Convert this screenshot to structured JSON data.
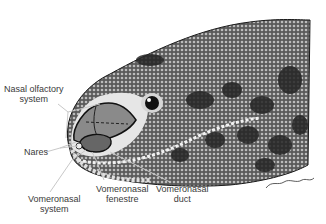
{
  "figure": {
    "signature": "Hornsby Rowe",
    "labels": [
      {
        "id": "nasal-olfactory",
        "lines": [
          "Nasal olfactory",
          "system"
        ]
      },
      {
        "id": "nares",
        "lines": [
          "Nares"
        ]
      },
      {
        "id": "vomeronasal-system",
        "lines": [
          "Vomeronasal",
          "system"
        ]
      },
      {
        "id": "vomeronasal-fenestre",
        "lines": [
          "Vomeronasal",
          "fenestre"
        ]
      },
      {
        "id": "vomeronasal-duct",
        "lines": [
          "Vomeronasal",
          "duct"
        ]
      }
    ],
    "colors": {
      "skin_dark": "#2a2a2a",
      "skin_mid": "#6b6b6b",
      "skin_light": "#bdbdbd",
      "snout_highlight": "#e6e6e6",
      "organ_fill": "#8a8a8a",
      "leader_line": "#c8c8c8",
      "text": "#3a3a3a"
    }
  }
}
